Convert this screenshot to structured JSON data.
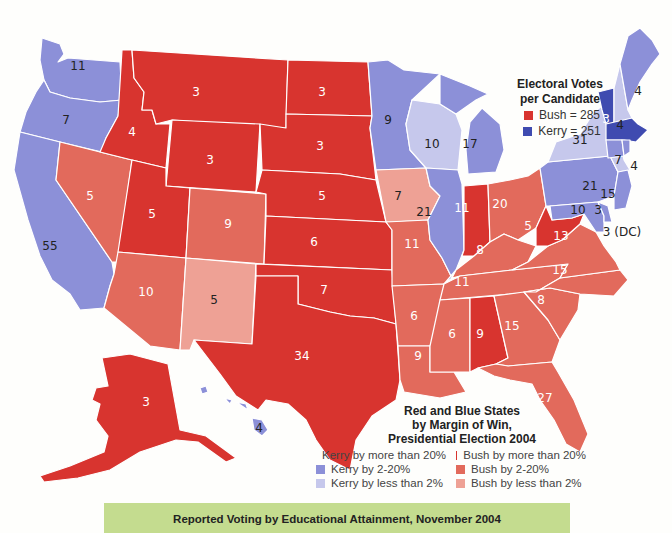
{
  "colors": {
    "kerry_20plus": "#3f4bb0",
    "kerry_2_20": "#8c90d8",
    "kerry_lt2": "#c6c8ec",
    "bush_20plus": "#d8342f",
    "bush_2_20": "#e26a5c",
    "bush_lt2": "#eea195"
  },
  "electoral_legend": {
    "title_line1": "Electoral Votes",
    "title_line2": "per Candidate",
    "items": [
      {
        "label": "Bush = 285",
        "color": "#d8342f"
      },
      {
        "label": "Kerry = 251",
        "color": "#3f4bb0"
      }
    ]
  },
  "margin_legend": {
    "title_line1": "Red and Blue States",
    "title_line2": "by Margin of Win,",
    "title_line3": "Presidential Election 2004",
    "items": [
      {
        "label": "Kerry by more than 20%",
        "color": "#3f4bb0"
      },
      {
        "label": "Bush by more than 20%",
        "color": "#d8342f"
      },
      {
        "label": "Kerry by 2-20%",
        "color": "#8c90d8"
      },
      {
        "label": "Bush by 2-20%",
        "color": "#e26a5c"
      },
      {
        "label": "Kerry by less than 2%",
        "color": "#c6c8ec"
      },
      {
        "label": "Bush by less than 2%",
        "color": "#eea195"
      }
    ]
  },
  "states": {
    "WA": "11",
    "OR": "7",
    "CA": "55",
    "NV": "5",
    "ID": "4",
    "MT": "3",
    "WY": "3",
    "UT": "5",
    "AZ": "10",
    "CO": "9",
    "NM": "5",
    "ND": "3",
    "SD": "3",
    "NE": "5",
    "KS": "6",
    "OK": "7",
    "TX": "34",
    "MN": "9",
    "IA": "7",
    "MO": "11",
    "AR": "6",
    "LA": "9",
    "WI": "10",
    "IL": "21",
    "MI": "17",
    "IN": "11",
    "OH": "20",
    "KY": "8",
    "TN": "11",
    "MS": "6",
    "AL": "9",
    "GA": "15",
    "FL": "27",
    "SC": "8",
    "NC": "15",
    "VA": "13",
    "WV": "5",
    "PA": "21",
    "NY": "31",
    "VT": "3",
    "NH": "4",
    "ME": "4",
    "MA": "12",
    "RI": "4",
    "CT": "7",
    "NJ": "15",
    "DE": "3",
    "MD": "10",
    "DC": "3 (DC)",
    "AK": "3",
    "HI": "4"
  },
  "banner": {
    "title": "Reported Voting by Educational Attainment, November 2004"
  }
}
